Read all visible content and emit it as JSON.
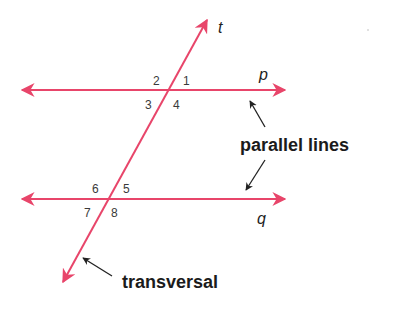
{
  "colors": {
    "line": "#e8456a",
    "pointer": "#222222",
    "text": "#1b1b1b"
  },
  "lines": {
    "p": {
      "label": "p"
    },
    "q": {
      "label": "q"
    },
    "t": {
      "label": "t"
    }
  },
  "angles": {
    "top": [
      "1",
      "2",
      "3",
      "4"
    ],
    "bottom": [
      "5",
      "6",
      "7",
      "8"
    ]
  },
  "labels": {
    "parallel": "parallel lines",
    "transversal": "transversal"
  }
}
